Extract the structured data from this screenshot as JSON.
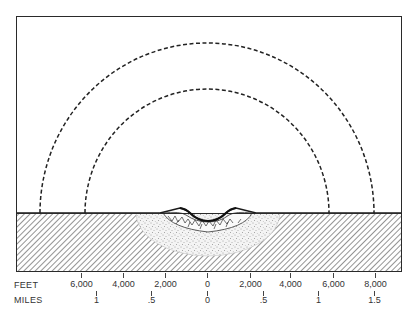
{
  "diagram": {
    "colors": {
      "ink": "#2a2a2a",
      "background": "#ffffff",
      "stipple": "#555555",
      "hatch": "#3a3a3a"
    },
    "layers": [
      {
        "id": "outer-arc",
        "style": "dashed"
      },
      {
        "id": "inner-arc",
        "style": "dashed"
      },
      {
        "id": "crater-bowl",
        "style": "solid"
      },
      {
        "id": "breccia-lens",
        "style": "network"
      },
      {
        "id": "stippled-zone",
        "style": "stipple"
      },
      {
        "id": "bedrock",
        "style": "diagonal-hatch"
      }
    ]
  },
  "scale": {
    "feet": {
      "label": "FEET",
      "ticks": [
        {
          "label": "6,000",
          "x": 81
        },
        {
          "label": "4,000",
          "x": 123
        },
        {
          "label": "2,000",
          "x": 165
        },
        {
          "label": "0",
          "x": 207
        },
        {
          "label": "2,000",
          "x": 250
        },
        {
          "label": "4,000",
          "x": 290
        },
        {
          "label": "6,000",
          "x": 333
        },
        {
          "label": "8,000",
          "x": 375
        }
      ]
    },
    "miles": {
      "label": "MILES",
      "ticks": [
        {
          "label": "1",
          "x": 96
        },
        {
          "label": ".5",
          "x": 151
        },
        {
          "label": "0",
          "x": 207
        },
        {
          "label": ".5",
          "x": 263
        },
        {
          "label": "1",
          "x": 318
        },
        {
          "label": "1.5",
          "x": 374
        }
      ]
    }
  }
}
